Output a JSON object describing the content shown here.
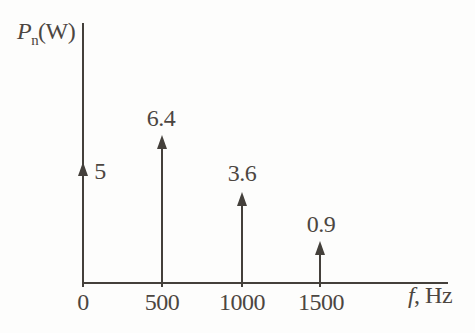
{
  "chart_data": {
    "type": "stem",
    "title": "",
    "xlabel": "f, Hz",
    "xlabel_italic": "f",
    "xlabel_rest": ", Hz",
    "ylabel": "Pn(W)",
    "ylabel_main": "P",
    "ylabel_sub": "n",
    "ylabel_unit": "(W)",
    "x": [
      0,
      500,
      1000,
      1500
    ],
    "values": [
      5,
      6.4,
      3.6,
      0.9
    ],
    "value_labels": [
      "5",
      "6.4",
      "3.6",
      "0.9"
    ],
    "categories": [
      "0",
      "500",
      "1000",
      "1500"
    ],
    "xlim": [
      0,
      2300
    ],
    "ylim": [
      0,
      8
    ],
    "grid": false,
    "legend": false,
    "marker": "up-arrow",
    "line_color": "#44403b",
    "text_color": "#4c4641",
    "background": "#fdfdfc"
  }
}
